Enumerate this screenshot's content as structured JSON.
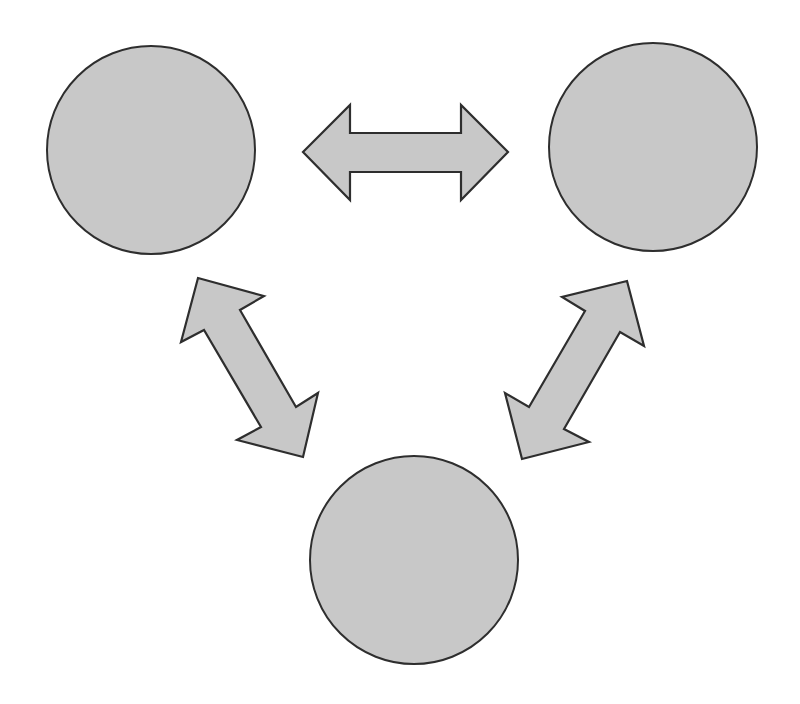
{
  "diagram": {
    "type": "cycle-triangle",
    "background": "#ffffff",
    "style": {
      "fill": "#c8c8c8",
      "stroke": "#2e2e2e"
    },
    "nodes": [
      {
        "id": "top-left",
        "label": "",
        "cx": 151,
        "cy": 150,
        "r": 104
      },
      {
        "id": "top-right",
        "label": "",
        "cx": 653,
        "cy": 147,
        "r": 104
      },
      {
        "id": "bottom",
        "label": "",
        "cx": 414,
        "cy": 560,
        "r": 104
      }
    ],
    "edges": [
      {
        "id": "top-left-to-top-right",
        "from": "top-left",
        "to": "top-right",
        "kind": "double-headed-arrow",
        "points": "303,152 350,105 350,133 461,133 461,105 508,152 461,200 461,172 350,172 350,200"
      },
      {
        "id": "top-left-to-bottom",
        "from": "top-left",
        "to": "bottom",
        "kind": "double-headed-arrow",
        "points": "198,278 264,296 240,310 296,407 318,393 303,457 237,440 261,427 204,330 181,342"
      },
      {
        "id": "top-right-to-bottom",
        "from": "top-right",
        "to": "bottom",
        "kind": "double-headed-arrow",
        "points": "627,281 644,346 620,332 564,429 589,442 522,459 505,393 529,407 585,311 562,297"
      }
    ]
  }
}
